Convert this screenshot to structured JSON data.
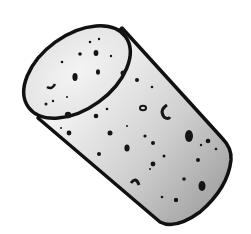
{
  "image": {
    "subject": "cork stopper illustration",
    "style": "black ink outline with grayscale shading",
    "colors": {
      "background": "#ffffff",
      "outline": "#111111",
      "top_face": "#ececec",
      "body_light": "#f2f2f2",
      "body_dark": "#a9a9a9",
      "pores": "#151515"
    }
  }
}
